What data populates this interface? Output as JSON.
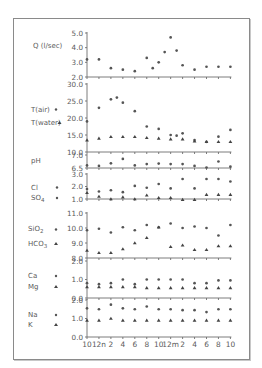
{
  "chart_data": {
    "type": "scatter",
    "title": "",
    "layout": "stacked multi-panel time series, shared x-axis",
    "x_tick_labels": [
      "10",
      "12n",
      "2",
      "4",
      "6",
      "8",
      "10",
      "12m",
      "2",
      "4",
      "6",
      "8",
      "10"
    ],
    "x_hours_per_tick": 2,
    "grid": false,
    "legend_position": "left of each panel",
    "panels": [
      {
        "id": "Q",
        "ylabel": "Q (l/sec)",
        "y_ticks": [
          "5.0",
          "4.0",
          "3.0",
          "2.0"
        ],
        "ylim": [
          2.0,
          5.0
        ],
        "series": [
          {
            "name": "Q (l/sec)",
            "marker": "circle",
            "x": [
              0,
              1,
              2,
              3,
              4,
              5,
              5.5,
              6,
              6.5,
              7,
              7.5,
              8,
              9,
              10,
              11,
              12
            ],
            "values": [
              3.2,
              3.2,
              2.6,
              2.5,
              2.4,
              3.3,
              2.6,
              3.0,
              3.7,
              4.7,
              3.8,
              2.8,
              2.5,
              2.7,
              2.7,
              2.7
            ]
          }
        ]
      },
      {
        "id": "T",
        "ylabel": "",
        "y_ticks": [
          "30.0",
          "25.0",
          "20.0",
          "15.0",
          "10.0"
        ],
        "ylim": [
          10.0,
          30.0
        ],
        "series": [
          {
            "name": "T(air)",
            "marker": "circle",
            "x": [
              0,
              1,
              2,
              2.5,
              3,
              4,
              5,
              6,
              7,
              7.5,
              8,
              9,
              10,
              11,
              12
            ],
            "values": [
              19.0,
              23.0,
              25.5,
              26.0,
              24.5,
              22.0,
              17.5,
              16.8,
              15.0,
              14.8,
              15.5,
              13.5,
              13.0,
              14.5,
              16.5
            ]
          },
          {
            "name": "T(water)",
            "marker": "triangle",
            "x": [
              0,
              1,
              2,
              3,
              4,
              5,
              6,
              7,
              8,
              9,
              10,
              11,
              12
            ],
            "values": [
              13.5,
              14.0,
              14.5,
              14.5,
              14.5,
              14.2,
              14.0,
              13.8,
              13.8,
              13.2,
              13.0,
              13.0,
              13.0
            ]
          }
        ]
      },
      {
        "id": "pH",
        "ylabel": "pH",
        "y_ticks": [
          "7.0",
          "6.5"
        ],
        "ylim": [
          6.5,
          7.0
        ],
        "series": [
          {
            "name": "pH",
            "marker": "circle",
            "x": [
              0,
              1,
              2,
              3,
              4,
              5,
              6,
              7,
              8,
              9,
              10,
              11,
              12
            ],
            "values": [
              6.6,
              6.58,
              6.68,
              6.85,
              6.6,
              6.65,
              6.67,
              6.65,
              6.65,
              6.58,
              6.52,
              6.75,
              6.55
            ]
          }
        ]
      },
      {
        "id": "ClSO4",
        "ylabel": "",
        "y_ticks": [
          "3.0",
          "2.0",
          "1.0"
        ],
        "ylim": [
          1.0,
          3.0
        ],
        "series": [
          {
            "name": "Cl",
            "marker": "circle",
            "x": [
              0,
              1,
              2,
              3,
              4,
              5,
              6,
              7,
              8,
              9,
              10,
              11,
              12
            ],
            "values": [
              1.8,
              1.6,
              1.7,
              1.55,
              2.05,
              1.9,
              2.2,
              1.85,
              2.6,
              1.85,
              2.6,
              2.6,
              2.4
            ]
          },
          {
            "name": "SO4",
            "marker": "triangle",
            "x": [
              0,
              1,
              2,
              3,
              4,
              5,
              6,
              7,
              8,
              9,
              10,
              11,
              12
            ],
            "values": [
              1.5,
              1.2,
              1.0,
              1.15,
              1.0,
              1.3,
              1.1,
              1.1,
              0.95,
              0.95,
              1.35,
              1.35,
              1.35
            ]
          }
        ]
      },
      {
        "id": "SiO2HCO3",
        "ylabel": "",
        "y_ticks": [
          "11.0",
          "10.0",
          "9.0",
          "8.0"
        ],
        "ylim": [
          8.0,
          11.0
        ],
        "series": [
          {
            "name": "SiO2",
            "marker": "circle",
            "x": [
              0,
              1,
              2,
              3,
              4,
              5,
              6,
              7,
              8,
              9,
              10,
              11,
              12
            ],
            "values": [
              9.85,
              9.95,
              9.7,
              10.05,
              9.85,
              10.2,
              10.05,
              10.3,
              10.0,
              10.1,
              10.0,
              9.5,
              10.2
            ]
          },
          {
            "name": "HCO3",
            "marker": "triangle",
            "x": [
              0,
              1,
              2,
              3,
              4,
              5,
              6,
              7,
              8,
              9,
              10,
              11,
              12
            ],
            "values": [
              8.5,
              8.35,
              8.35,
              8.6,
              9.0,
              9.35,
              10.05,
              8.75,
              8.85,
              8.55,
              8.55,
              8.8,
              8.8
            ]
          }
        ]
      },
      {
        "id": "CaMg",
        "ylabel": "",
        "y_ticks": [
          "2.0",
          "1.0",
          "0.0"
        ],
        "ylim": [
          0.0,
          2.0
        ],
        "series": [
          {
            "name": "Ca",
            "marker": "circle",
            "x": [
              0,
              1,
              2,
              3,
              4,
              5,
              6,
              7,
              8,
              9,
              10,
              11,
              12
            ],
            "values": [
              0.8,
              0.75,
              0.8,
              1.0,
              0.75,
              1.0,
              1.0,
              1.0,
              1.0,
              0.8,
              0.8,
              0.95,
              0.95
            ]
          },
          {
            "name": "Mg",
            "marker": "triangle",
            "x": [
              0,
              1,
              2,
              3,
              4,
              5,
              6,
              7,
              8,
              9,
              10,
              11,
              12
            ],
            "values": [
              0.6,
              0.6,
              0.6,
              0.6,
              0.6,
              0.55,
              0.55,
              0.55,
              0.55,
              0.55,
              0.55,
              0.55,
              0.55
            ]
          }
        ]
      },
      {
        "id": "NaK",
        "ylabel": "",
        "y_ticks": [
          "2.0",
          "1.0",
          "0.0"
        ],
        "ylim": [
          0.0,
          2.0
        ],
        "series": [
          {
            "name": "Na",
            "marker": "circle",
            "x": [
              0,
              1,
              2,
              3,
              4,
              5,
              6,
              7,
              8,
              9,
              10,
              11,
              12
            ],
            "values": [
              1.55,
              1.5,
              1.75,
              1.55,
              1.5,
              1.65,
              1.5,
              1.5,
              1.45,
              1.45,
              1.35,
              1.5,
              1.5
            ]
          },
          {
            "name": "K",
            "marker": "triangle",
            "x": [
              0,
              1,
              2,
              3,
              4,
              5,
              6,
              7,
              8,
              9,
              10,
              11,
              12
            ],
            "values": [
              0.9,
              0.9,
              1.0,
              0.9,
              0.9,
              0.9,
              0.9,
              0.9,
              0.9,
              0.9,
              0.9,
              0.9,
              0.9
            ]
          }
        ]
      }
    ]
  },
  "labels": {
    "q": "Q (l/sec)",
    "t_air": "T(air)",
    "t_water": "T(water)",
    "ph": "pH",
    "cl": "Cl",
    "so4": "SO",
    "so4_sub": "4",
    "sio2_a": "SiO",
    "sio2_sub": "2",
    "hco3_a": "HCO",
    "hco3_sub": "3",
    "ca": "Ca",
    "mg": "Mg",
    "na": "Na",
    "k": "K"
  },
  "layout_px": {
    "x0": 87,
    "dx": 11.95,
    "panels": [
      {
        "top": 33,
        "bottom": 77
      },
      {
        "top": 84,
        "bottom": 152
      },
      {
        "top": 155,
        "bottom": 168
      },
      {
        "top": 174,
        "bottom": 199
      },
      {
        "top": 213,
        "bottom": 258
      },
      {
        "top": 261,
        "bottom": 298
      },
      {
        "top": 300,
        "bottom": 337
      }
    ]
  }
}
